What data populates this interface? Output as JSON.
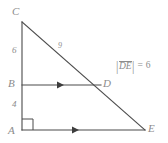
{
  "figure": {
    "type": "geometry-diagram",
    "background_color": "#ffffff",
    "line_color": "#4a4a4a",
    "label_color": "#8c8c8c",
    "vertices": [
      {
        "name": "C",
        "label": "C",
        "x": 22,
        "y": 22,
        "label_x": 12,
        "label_y": 6
      },
      {
        "name": "B",
        "label": "B",
        "x": 22,
        "y": 85,
        "label_x": 8,
        "label_y": 79
      },
      {
        "name": "A",
        "label": "A",
        "x": 22,
        "y": 130,
        "label_x": 8,
        "label_y": 126
      },
      {
        "name": "D",
        "label": "D",
        "x": 100,
        "y": 85,
        "label_x": 103,
        "label_y": 79
      },
      {
        "name": "E",
        "label": "E",
        "x": 145,
        "y": 130,
        "label_x": 148,
        "label_y": 124
      }
    ],
    "segments": [
      {
        "name": "CA",
        "from": "C",
        "to": "A",
        "marker": "none"
      },
      {
        "name": "CE",
        "from": "C",
        "to": "E",
        "marker": "none"
      },
      {
        "name": "BD",
        "from": "B",
        "to": "D",
        "marker": "arrow-single"
      },
      {
        "name": "AE",
        "from": "A",
        "to": "E",
        "marker": "arrow-single"
      }
    ],
    "length_labels": [
      {
        "name": "CB-length",
        "text": "6",
        "x": 13,
        "y": 46
      },
      {
        "name": "BA-length",
        "text": "4",
        "x": 13,
        "y": 100
      },
      {
        "name": "CD-length",
        "text": "9",
        "x": 58,
        "y": 42
      }
    ],
    "right_angle": {
      "name": "right-angle-at-A",
      "vertex": "A",
      "x": 22,
      "y": 130,
      "size": 10
    },
    "annotation": {
      "name": "de-length-annotation",
      "bar_left": "|",
      "segment_text": "DE",
      "equals": "=",
      "value": "6",
      "x": 116,
      "y": 62
    }
  }
}
